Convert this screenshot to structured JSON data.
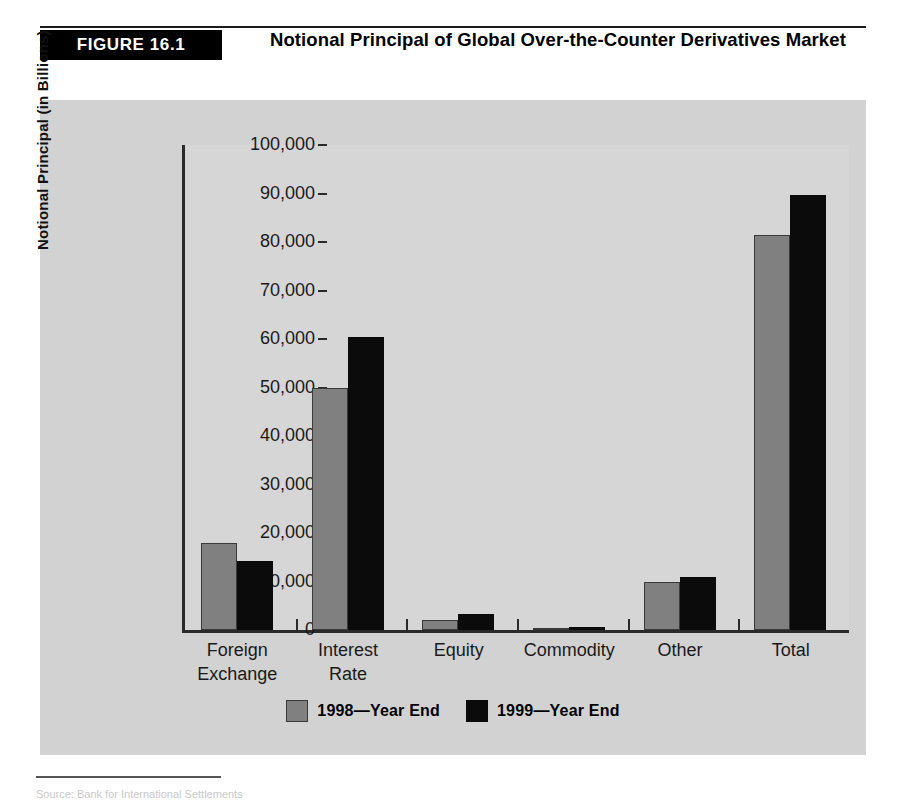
{
  "figure": {
    "badge": "FIGURE 16.1",
    "title": "Notional Principal of Global Over-the-Counter Derivatives Market"
  },
  "footer": {
    "source": "Source: Bank for International Settlements"
  },
  "colors": {
    "series_1998": "#808080",
    "series_1999": "#0b0b0b",
    "panel_background": "#d2d2d2",
    "axis": "#2a2a2a"
  },
  "chart_data": {
    "type": "bar",
    "title": "Notional Principal of Global Over-the-Counter Derivatives Market",
    "xlabel": "",
    "ylabel": "Notional Principal (in Billions)",
    "ylim": [
      0,
      100000
    ],
    "ytick_labels": [
      "100,000",
      "90,000",
      "80,000",
      "70,000",
      "60,000",
      "50,000",
      "40,000",
      "30,000",
      "20,000",
      "10,000",
      "0"
    ],
    "ytick_values": [
      100000,
      90000,
      80000,
      70000,
      60000,
      50000,
      40000,
      30000,
      20000,
      10000,
      0
    ],
    "grid": false,
    "legend_position": "bottom",
    "categories": [
      "Foreign Exchange",
      "Interest Rate",
      "Equity",
      "Commodity",
      "Other",
      "Total"
    ],
    "category_lines": [
      [
        "Foreign",
        "Exchange"
      ],
      [
        "Interest",
        "Rate"
      ],
      [
        "Equity"
      ],
      [
        "Commodity"
      ],
      [
        "Other"
      ],
      [
        "Total"
      ]
    ],
    "series": [
      {
        "name": "1998—Year End",
        "color": "#808080",
        "values": [
          18000,
          50000,
          2000,
          400,
          10000,
          81500
        ]
      },
      {
        "name": "1999—Year End",
        "color": "#0b0b0b",
        "values": [
          14300,
          60400,
          3200,
          600,
          11000,
          89700
        ]
      }
    ]
  }
}
